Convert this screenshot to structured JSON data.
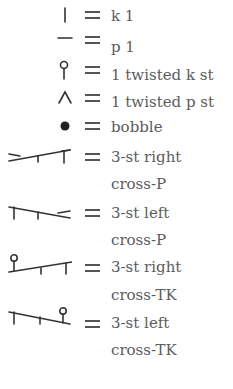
{
  "legend": {
    "items": [
      {
        "symbol": "vertical-bar-icon",
        "label": "k 1"
      },
      {
        "symbol": "horizontal-dash-icon",
        "label": "p 1"
      },
      {
        "symbol": "twisted-knit-icon",
        "label": "1 twisted k st"
      },
      {
        "symbol": "twisted-purl-icon",
        "label": "1 twisted p st"
      },
      {
        "symbol": "bobble-icon",
        "label": "bobble"
      },
      {
        "symbol": "right-cross-purl-icon",
        "label": "3-st right",
        "label2": "cross-P"
      },
      {
        "symbol": "left-cross-purl-icon",
        "label": "3-st left",
        "label2": "cross-P"
      },
      {
        "symbol": "right-cross-twisted-knit-icon",
        "label": "3-st right",
        "label2": "cross-TK"
      },
      {
        "symbol": "left-cross-twisted-knit-icon",
        "label": "3-st left",
        "label2": "cross-TK"
      }
    ],
    "equals": "="
  }
}
